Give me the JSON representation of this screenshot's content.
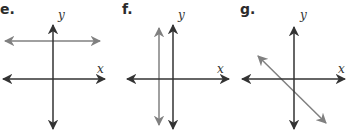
{
  "panels": [
    {
      "label": "e.",
      "x_axis_label": "x",
      "y_axis_label": "y",
      "line_description": "horizontal line above x-axis"
    },
    {
      "label": "f.",
      "x_axis_label": "x",
      "y_axis_label": "y",
      "line_description": "vertical line left of y-axis"
    },
    {
      "label": "g.",
      "x_axis_label": "x",
      "y_axis_label": "y",
      "line_description": "diagonal line with negative slope"
    }
  ],
  "colors": {
    "axis": "#333333",
    "line": "#808080"
  }
}
